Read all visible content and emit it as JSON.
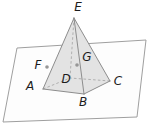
{
  "figure": {
    "background": "#ffffff",
    "label_color": "#1c1c1c",
    "label_font_size": 12,
    "plane": {
      "fill": "#fdfdfd",
      "stroke": "#9f9f9f",
      "stroke_width": 1,
      "points": [
        [
          17,
          48
        ],
        [
          146,
          40
        ],
        [
          137,
          117
        ],
        [
          3,
          122
        ]
      ]
    },
    "pyramid": {
      "fill": "#e3e3e3",
      "edge_color": "#8d8d8d",
      "edge_width": 1,
      "hidden_edge_color": "#a9a9a9",
      "hidden_edge_width": 0.9,
      "hidden_edge_dash": "2.6 2.2",
      "silhouette": [
        "E",
        "A",
        "B",
        "C"
      ],
      "solid_edges": [
        [
          "E",
          "A"
        ],
        [
          "E",
          "B"
        ],
        [
          "E",
          "C"
        ],
        [
          "A",
          "B"
        ],
        [
          "B",
          "C"
        ]
      ],
      "dashed_edges": [
        [
          "E",
          "D"
        ],
        [
          "A",
          "D"
        ],
        [
          "C",
          "D"
        ]
      ]
    },
    "vertices": {
      "E": [
        74,
        18
      ],
      "A": [
        43,
        89
      ],
      "B": [
        84,
        94
      ],
      "C": [
        110,
        81
      ],
      "D": [
        70,
        78
      ]
    },
    "labels": [
      {
        "text": "E",
        "x": 78,
        "y": 7
      },
      {
        "text": "A",
        "x": 30,
        "y": 86
      },
      {
        "text": "B",
        "x": 83,
        "y": 102
      },
      {
        "text": "C",
        "x": 118,
        "y": 81
      },
      {
        "text": "D",
        "x": 66,
        "y": 79
      },
      {
        "text": "F",
        "x": 38,
        "y": 65
      },
      {
        "text": "G",
        "x": 87,
        "y": 57
      }
    ],
    "marked_points": [
      {
        "text": "F",
        "x": 47,
        "y": 67
      },
      {
        "text": "G",
        "x": 77,
        "y": 65
      }
    ],
    "dot_color": "#979797",
    "dot_radius": 1.8
  }
}
